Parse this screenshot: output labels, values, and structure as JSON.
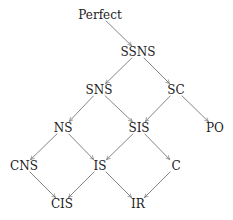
{
  "diagram": {
    "type": "directed-graph",
    "edge_color": "#666666",
    "text_color": "#222222",
    "nodes": [
      {
        "id": "Perfect",
        "label": "Perfect",
        "x": 100,
        "y": 15
      },
      {
        "id": "SSNS",
        "label": "SSNS",
        "x": 138,
        "y": 52
      },
      {
        "id": "SNS",
        "label": "SNS",
        "x": 99,
        "y": 90
      },
      {
        "id": "SC",
        "label": "SC",
        "x": 176,
        "y": 90
      },
      {
        "id": "NS",
        "label": "NS",
        "x": 63,
        "y": 128
      },
      {
        "id": "SIS",
        "label": "SIS",
        "x": 139,
        "y": 128
      },
      {
        "id": "PO",
        "label": "PO",
        "x": 215,
        "y": 128
      },
      {
        "id": "CNS",
        "label": "CNS",
        "x": 24,
        "y": 166
      },
      {
        "id": "IS",
        "label": "IS",
        "x": 100,
        "y": 166
      },
      {
        "id": "C",
        "label": "C",
        "x": 176,
        "y": 166
      },
      {
        "id": "CIS",
        "label": "CIS",
        "x": 62,
        "y": 204
      },
      {
        "id": "IR",
        "label": "IR",
        "x": 138,
        "y": 204
      }
    ],
    "edges": [
      {
        "from": "Perfect",
        "to": "SSNS"
      },
      {
        "from": "SSNS",
        "to": "SNS"
      },
      {
        "from": "SSNS",
        "to": "SC"
      },
      {
        "from": "SNS",
        "to": "NS"
      },
      {
        "from": "SNS",
        "to": "SIS"
      },
      {
        "from": "SC",
        "to": "SIS"
      },
      {
        "from": "SC",
        "to": "PO"
      },
      {
        "from": "NS",
        "to": "CNS"
      },
      {
        "from": "NS",
        "to": "IS"
      },
      {
        "from": "SIS",
        "to": "IS"
      },
      {
        "from": "SIS",
        "to": "C"
      },
      {
        "from": "CNS",
        "to": "CIS"
      },
      {
        "from": "IS",
        "to": "CIS"
      },
      {
        "from": "IS",
        "to": "IR"
      },
      {
        "from": "C",
        "to": "IR"
      }
    ]
  }
}
